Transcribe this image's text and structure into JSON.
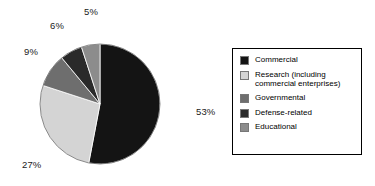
{
  "chart_data": {
    "type": "pie",
    "title": "",
    "subtitle": "",
    "xlabel": "",
    "ylabel": "",
    "grid": false,
    "legend_position": "right",
    "start_angle_deg": 0,
    "direction": "clockwise",
    "categories": [
      "Commercial",
      "Research (including commercial enterprises)",
      "Governmental",
      "Defense-related",
      "Educational"
    ],
    "values": [
      53,
      27,
      9,
      6,
      5
    ],
    "value_unit": "%",
    "colors": [
      "#141414",
      "#d4d4d4",
      "#6e6e6e",
      "#2a2a2a",
      "#8c8c8c"
    ],
    "slices": [
      {
        "label": "Commercial",
        "value": 53,
        "display": "53%",
        "color": "#141414",
        "start_deg": 0,
        "end_deg": 190.8
      },
      {
        "label": "Research (including commercial enterprises)",
        "value": 27,
        "display": "27%",
        "color": "#d4d4d4",
        "start_deg": 190.8,
        "end_deg": 288.0
      },
      {
        "label": "Governmental",
        "value": 9,
        "display": "9%",
        "color": "#6e6e6e",
        "start_deg": 288.0,
        "end_deg": 320.4
      },
      {
        "label": "Defense-related",
        "value": 6,
        "display": "6%",
        "color": "#2a2a2a",
        "start_deg": 320.4,
        "end_deg": 342.0
      },
      {
        "label": "Educational",
        "value": 5,
        "display": "5%",
        "color": "#8c8c8c",
        "start_deg": 342.0,
        "end_deg": 360.0
      }
    ]
  },
  "labels": {
    "commercial_pct": "53%",
    "research_pct": "27%",
    "governmental_pct": "9%",
    "defense_pct": "6%",
    "educational_pct": "5%"
  },
  "legend": {
    "items": [
      {
        "label": "Commercial",
        "color": "#141414"
      },
      {
        "label": "Research (including\ncommercial enterprises)",
        "color": "#d4d4d4"
      },
      {
        "label": "Governmental",
        "color": "#6e6e6e"
      },
      {
        "label": "Defense-related",
        "color": "#2a2a2a"
      },
      {
        "label": "Educational",
        "color": "#8c8c8c"
      }
    ]
  },
  "style": {
    "background": "#ffffff",
    "outline": "#000000",
    "text": "#000000"
  }
}
